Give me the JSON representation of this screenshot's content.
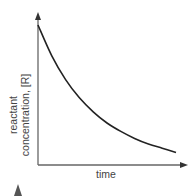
{
  "chart_data": {
    "type": "line",
    "title": "",
    "xlabel": "time",
    "ylabel": "reactant concentration, [R]",
    "ylabel_lines": [
      "reactant",
      "concentration, [R]"
    ],
    "x_ticks": [],
    "y_ticks": [],
    "grid": false,
    "legend": null,
    "series": [
      {
        "name": "[R]",
        "description": "exponential decay of reactant concentration over time",
        "x": [
          0,
          0.1,
          0.2,
          0.3,
          0.4,
          0.5,
          0.6,
          0.7,
          0.8,
          0.9,
          1.0
        ],
        "values": [
          1.0,
          0.78,
          0.61,
          0.48,
          0.38,
          0.3,
          0.24,
          0.19,
          0.15,
          0.12,
          0.09
        ]
      }
    ],
    "xlim": [
      0,
      1.1
    ],
    "ylim": [
      0,
      1.1
    ]
  },
  "colors": {
    "axis": "#555555",
    "curve": "#222222",
    "text": "#444444",
    "marker": "#555555"
  }
}
